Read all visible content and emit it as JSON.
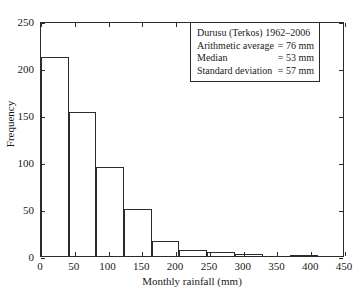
{
  "chart_data": {
    "type": "bar",
    "title": "",
    "xlabel": "Monthly rainfall (mm)",
    "ylabel": "Frequency",
    "xlim": [
      0,
      450
    ],
    "ylim": [
      0,
      250
    ],
    "xticks": [
      0,
      50,
      100,
      150,
      200,
      250,
      300,
      350,
      400,
      450
    ],
    "yticks": [
      0,
      50,
      100,
      150,
      200,
      250
    ],
    "grid": false,
    "legend_position": "upper-right",
    "bin_edges": [
      0,
      41,
      82,
      123,
      164,
      205,
      246,
      287,
      328,
      369,
      410
    ],
    "categories": [
      "0-41",
      "41-82",
      "82-123",
      "123-164",
      "164-205",
      "205-246",
      "246-287",
      "287-328",
      "328-369",
      "369-410"
    ],
    "values": [
      212,
      153,
      95,
      50,
      16,
      6,
      4,
      2,
      0,
      1
    ],
    "bar_fill": "#ffffff",
    "bar_edge": "#2b2b2b",
    "annotations": [
      "Durusu (Terkos) 1962–2006",
      "Arithmetic average = 76 mm",
      "Median = 53 mm",
      "Standard deviation = 57 mm"
    ]
  },
  "stats": {
    "title": "Durusu (Terkos) 1962–2006",
    "rows": [
      {
        "key": "Arithmetic average",
        "value": "= 76 mm"
      },
      {
        "key": "Median",
        "value": "= 53 mm"
      },
      {
        "key": "Standard deviation",
        "value": "= 57 mm"
      }
    ]
  },
  "axes": {
    "x_title": "Monthly rainfall (mm)",
    "y_title": "Frequency",
    "x_tick_labels": [
      "0",
      "50",
      "100",
      "150",
      "200",
      "250",
      "300",
      "350",
      "400",
      "450"
    ],
    "y_tick_labels": [
      "0",
      "50",
      "100",
      "150",
      "200",
      "250"
    ]
  }
}
